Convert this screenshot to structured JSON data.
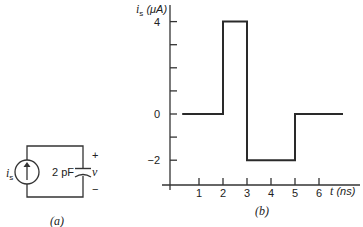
{
  "circuit": {
    "source_label": "i",
    "source_label_sub": "s",
    "capacitor_label": "2 pF",
    "voltage_label": "v",
    "plus": "+",
    "minus": "−",
    "caption": "(a)"
  },
  "plot": {
    "y_label_main": "i",
    "y_label_sub": "s",
    "y_label_unit": " (μA)",
    "x_label_main": "t",
    "x_label_unit": " (ns)",
    "y_ticks": [
      {
        "v": 4,
        "label": "4"
      },
      {
        "v": 3,
        "label": ""
      },
      {
        "v": 2,
        "label": ""
      },
      {
        "v": 1,
        "label": ""
      },
      {
        "v": 0,
        "label": "0"
      },
      {
        "v": -1,
        "label": ""
      },
      {
        "v": -2,
        "label": "−2"
      }
    ],
    "x_ticks": [
      {
        "v": 1,
        "label": "1"
      },
      {
        "v": 2,
        "label": "2"
      },
      {
        "v": 3,
        "label": "3"
      },
      {
        "v": 4,
        "label": "4"
      },
      {
        "v": 5,
        "label": "5"
      },
      {
        "v": 6,
        "label": "6"
      }
    ],
    "caption": "(b)"
  },
  "chart_data": {
    "type": "line",
    "title": "",
    "xlabel": "t (ns)",
    "ylabel": "i_s (μA)",
    "x": [
      0.3,
      2,
      2,
      3,
      3,
      5,
      5,
      7
    ],
    "y": [
      0,
      0,
      4,
      4,
      -2,
      -2,
      0,
      0
    ],
    "xticks": [
      1,
      2,
      3,
      4,
      5,
      6
    ],
    "yticks": [
      4,
      0,
      -2
    ],
    "xlim": [
      0,
      7.3
    ],
    "ylim": [
      -3,
      4.5
    ],
    "grid": false,
    "legend": null
  }
}
